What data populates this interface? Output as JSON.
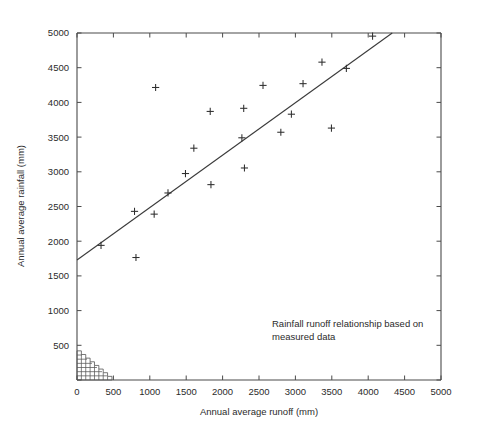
{
  "chart_data": {
    "type": "scatter",
    "title": "",
    "xlabel": "Annual average runoff (mm)",
    "ylabel": "Annual average rainfall (mm)",
    "xlim": [
      0,
      5000
    ],
    "ylim": [
      0,
      5000
    ],
    "xticks": [
      0,
      500,
      1000,
      1500,
      2000,
      2500,
      3000,
      3500,
      4000,
      4500,
      5000
    ],
    "yticks": [
      0,
      500,
      1000,
      1500,
      2000,
      2500,
      3000,
      3500,
      4000,
      4500,
      5000
    ],
    "xtick_labels": [
      "0",
      "500",
      "1000",
      "1500",
      "2000",
      "2500",
      "3000",
      "3500",
      "4000",
      "4500",
      "5000"
    ],
    "ytick_labels": [
      "0",
      "500",
      "1000",
      "1500",
      "2000",
      "2500",
      "3000",
      "3500",
      "4000",
      "4500",
      "5000"
    ],
    "grid": false,
    "legend": "none",
    "marker": "plus",
    "annotations": [
      {
        "name": "rainfall-runoff-note",
        "lines": [
          "Rainfall runoff relationship based on",
          "measured data"
        ],
        "x": 2480,
        "y": 900
      }
    ],
    "series": [
      {
        "name": "Measured catchment data",
        "type": "scatter",
        "marker": "plus",
        "points": [
          {
            "x": 330,
            "y": 1940
          },
          {
            "x": 790,
            "y": 2430
          },
          {
            "x": 810,
            "y": 1765
          },
          {
            "x": 1060,
            "y": 2390
          },
          {
            "x": 1080,
            "y": 4215
          },
          {
            "x": 1250,
            "y": 2695
          },
          {
            "x": 1490,
            "y": 2975
          },
          {
            "x": 1605,
            "y": 3340
          },
          {
            "x": 1830,
            "y": 3870
          },
          {
            "x": 1840,
            "y": 2815
          },
          {
            "x": 2265,
            "y": 3490
          },
          {
            "x": 2290,
            "y": 3915
          },
          {
            "x": 2300,
            "y": 3055
          },
          {
            "x": 2555,
            "y": 4245
          },
          {
            "x": 2800,
            "y": 3570
          },
          {
            "x": 2945,
            "y": 3830
          },
          {
            "x": 3105,
            "y": 4270
          },
          {
            "x": 3365,
            "y": 4580
          },
          {
            "x": 3495,
            "y": 3630
          },
          {
            "x": 3700,
            "y": 4490
          },
          {
            "x": 4060,
            "y": 4955
          }
        ]
      },
      {
        "name": "Fitted rainfall-runoff line",
        "type": "line",
        "points": [
          {
            "x": 0,
            "y": 1730
          },
          {
            "x": 4330,
            "y": 5000
          }
        ]
      }
    ],
    "shaded_region": {
      "name": "low-runoff-hatched-wedge",
      "style": "cross-hatched",
      "vertices": [
        {
          "x": 0,
          "y": 0
        },
        {
          "x": 0,
          "y": 420
        },
        {
          "x": 480,
          "y": 0
        }
      ]
    }
  },
  "axes": {
    "x_title": "Annual average runoff (mm)",
    "y_title": "Annual average rainfall (mm)"
  },
  "annotation": {
    "line1": "Rainfall runoff relationship based on",
    "line2": "measured data"
  },
  "x_labels": {
    "t0": "0",
    "t1": "500",
    "t2": "1000",
    "t3": "1500",
    "t4": "2000",
    "t5": "2500",
    "t6": "3000",
    "t7": "3500",
    "t8": "4000",
    "t9": "4500",
    "t10": "5000"
  },
  "y_labels": {
    "t0": "0",
    "t1": "500",
    "t2": "1000",
    "t3": "1500",
    "t4": "2000",
    "t5": "2500",
    "t6": "3000",
    "t7": "3500",
    "t8": "4000",
    "t9": "4500",
    "t10": "5000"
  },
  "colors": {
    "axis": "#4a4a4a",
    "marker": "#2e2e2e",
    "line": "#3a3a3a",
    "text": "#2b2b2b",
    "background": "#ffffff"
  }
}
